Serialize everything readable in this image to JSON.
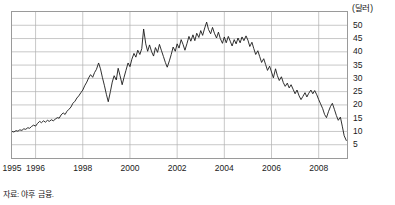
{
  "unit_label": "(달러)",
  "source_note": "자료: 야후 금융.",
  "axis": {
    "y_ticks": [
      "50",
      "45",
      "40",
      "35",
      "30",
      "25",
      "20",
      "15",
      "10",
      "5"
    ],
    "x_ticks": [
      "1995",
      "1996",
      "1998",
      "2000",
      "2002",
      "2004",
      "2006",
      "2008"
    ]
  },
  "colors": {
    "line": "#1a1a1a",
    "grid": "#b0b0b0",
    "frame": "#9a9a9a",
    "text": "#1a1a1a",
    "background": "#ffffff"
  },
  "chart_data": {
    "type": "line",
    "title": "",
    "subtitle": "",
    "xlabel": "",
    "ylabel": "(달러)",
    "unit": "달러",
    "grid": true,
    "legend": "none",
    "xlim": [
      1995.0,
      2009.2
    ],
    "ylim": [
      0,
      55
    ],
    "y_tick_values": [
      50,
      45,
      40,
      35,
      30,
      25,
      20,
      15,
      10,
      5
    ],
    "x_tick_values": [
      1995,
      1996,
      1998,
      2000,
      2002,
      2004,
      2006,
      2008
    ],
    "source": "자료: 야후 금융.",
    "series": [
      {
        "name": "주가",
        "x": [
          1995.0,
          1995.08,
          1995.17,
          1995.25,
          1995.33,
          1995.42,
          1995.5,
          1995.58,
          1995.67,
          1995.75,
          1995.83,
          1995.92,
          1996.0,
          1996.08,
          1996.17,
          1996.25,
          1996.33,
          1996.42,
          1996.5,
          1996.58,
          1996.67,
          1996.75,
          1996.83,
          1996.92,
          1997.0,
          1997.08,
          1997.17,
          1997.25,
          1997.33,
          1997.42,
          1997.5,
          1997.58,
          1997.67,
          1997.75,
          1997.83,
          1997.92,
          1998.0,
          1998.08,
          1998.17,
          1998.25,
          1998.33,
          1998.42,
          1998.5,
          1998.58,
          1998.67,
          1998.75,
          1998.83,
          1998.92,
          1999.0,
          1999.08,
          1999.17,
          1999.25,
          1999.33,
          1999.42,
          1999.5,
          1999.58,
          1999.67,
          1999.75,
          1999.83,
          1999.92,
          2000.0,
          2000.08,
          2000.17,
          2000.25,
          2000.33,
          2000.42,
          2000.5,
          2000.58,
          2000.67,
          2000.75,
          2000.83,
          2000.92,
          2001.0,
          2001.08,
          2001.17,
          2001.25,
          2001.33,
          2001.42,
          2001.5,
          2001.58,
          2001.67,
          2001.75,
          2001.83,
          2001.92,
          2002.0,
          2002.08,
          2002.17,
          2002.25,
          2002.33,
          2002.42,
          2002.5,
          2002.58,
          2002.67,
          2002.75,
          2002.83,
          2002.92,
          2003.0,
          2003.08,
          2003.17,
          2003.25,
          2003.33,
          2003.42,
          2003.5,
          2003.58,
          2003.67,
          2003.75,
          2003.83,
          2003.92,
          2004.0,
          2004.08,
          2004.17,
          2004.25,
          2004.33,
          2004.42,
          2004.5,
          2004.58,
          2004.67,
          2004.75,
          2004.83,
          2004.92,
          2005.0,
          2005.08,
          2005.17,
          2005.25,
          2005.33,
          2005.42,
          2005.5,
          2005.58,
          2005.67,
          2005.75,
          2005.83,
          2005.92,
          2006.0,
          2006.08,
          2006.17,
          2006.25,
          2006.33,
          2006.42,
          2006.5,
          2006.58,
          2006.67,
          2006.75,
          2006.83,
          2006.92,
          2007.0,
          2007.08,
          2007.17,
          2007.25,
          2007.33,
          2007.42,
          2007.5,
          2007.58,
          2007.67,
          2007.75,
          2007.83,
          2007.92,
          2008.0,
          2008.08,
          2008.17,
          2008.25,
          2008.33,
          2008.42,
          2008.5,
          2008.58,
          2008.67,
          2008.75,
          2008.83,
          2008.92,
          2009.0,
          2009.08,
          2009.17
        ],
        "values": [
          10.0,
          9.8,
          10.3,
          10.1,
          10.6,
          10.4,
          11.0,
          10.8,
          11.4,
          11.2,
          11.9,
          12.4,
          12.0,
          13.0,
          13.8,
          13.3,
          14.0,
          13.5,
          14.2,
          13.8,
          14.4,
          14.0,
          14.6,
          15.2,
          15.0,
          16.2,
          17.0,
          16.4,
          17.6,
          18.4,
          19.2,
          20.6,
          21.4,
          22.6,
          23.4,
          24.6,
          25.6,
          27.2,
          28.6,
          30.2,
          31.4,
          30.4,
          32.2,
          33.4,
          35.8,
          33.6,
          30.4,
          27.2,
          24.0,
          21.2,
          25.0,
          28.6,
          31.0,
          29.4,
          33.8,
          31.0,
          27.6,
          30.4,
          33.0,
          35.8,
          34.4,
          37.2,
          39.4,
          38.0,
          40.6,
          39.0,
          41.2,
          48.6,
          43.0,
          40.2,
          42.6,
          40.0,
          38.4,
          41.6,
          39.8,
          42.8,
          40.6,
          38.2,
          36.0,
          34.2,
          36.6,
          39.0,
          41.8,
          40.2,
          43.0,
          41.4,
          44.6,
          42.8,
          40.6,
          43.2,
          45.8,
          44.0,
          46.4,
          44.2,
          47.0,
          45.4,
          48.0,
          46.2,
          49.0,
          51.2,
          48.4,
          46.8,
          49.2,
          47.0,
          45.2,
          47.4,
          45.0,
          43.2,
          45.6,
          43.4,
          45.8,
          44.0,
          42.2,
          44.6,
          43.0,
          45.2,
          43.4,
          45.6,
          44.2,
          46.0,
          44.4,
          42.0,
          43.6,
          41.2,
          39.0,
          40.4,
          38.2,
          36.0,
          37.4,
          35.2,
          33.0,
          34.6,
          32.4,
          30.2,
          33.6,
          31.0,
          29.2,
          30.6,
          28.4,
          27.0,
          28.2,
          26.4,
          27.6,
          25.8,
          24.2,
          25.6,
          23.4,
          22.0,
          23.2,
          24.6,
          23.0,
          24.4,
          25.6,
          24.2,
          25.4,
          23.8,
          22.0,
          20.4,
          18.6,
          16.4,
          15.2,
          17.6,
          19.4,
          20.6,
          18.2,
          16.0,
          14.2,
          15.4,
          12.0,
          8.4,
          6.6
        ]
      }
    ],
    "annotations": {
      "start_value": 10.0,
      "peak_value": 51.2,
      "peak_x": 2002.25,
      "end_value": 6.6,
      "trough_1998": 21.2,
      "spike_2000": 48.6
    }
  }
}
